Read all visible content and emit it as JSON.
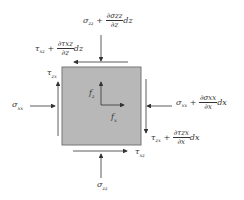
{
  "diagram": {
    "title": "",
    "element_fill": "#b8b8b8",
    "element_stroke": "#777777",
    "labels": {
      "top_normal": {
        "base": "σ",
        "sub": "zz",
        "op": "+",
        "num": "∂σzz",
        "den": "∂z",
        "tail": "dz"
      },
      "top_shear": {
        "base": "τ",
        "sub": "xz",
        "op": "+",
        "num": "∂τxz",
        "den": "∂z",
        "tail": "dz"
      },
      "left_shear": {
        "base": "τ",
        "sub": "zx"
      },
      "left_normal": {
        "base": "σ",
        "sub": "xx"
      },
      "right_normal": {
        "base": "σ",
        "sub": "xx",
        "op": "+",
        "num": "∂σxx",
        "den": "∂x",
        "tail": "dx"
      },
      "right_shear": {
        "base": "τ",
        "sub": "zx",
        "op": "+",
        "num": "∂τzx",
        "den": "∂x",
        "tail": "dx"
      },
      "bottom_shear": {
        "base": "τ",
        "sub": "xz"
      },
      "bottom_normal": {
        "base": "σ",
        "sub": "zz"
      },
      "body_force_z": {
        "base": "f",
        "sub": "z"
      },
      "body_force_x": {
        "base": "f",
        "sub": "x"
      }
    }
  }
}
